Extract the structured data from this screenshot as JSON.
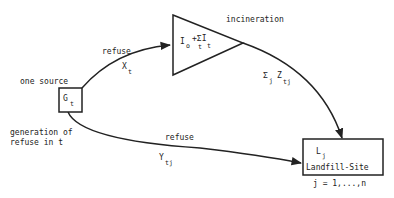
{
  "nodes": {
    "source": {
      "symbol": "G",
      "subscript": "t",
      "label_above": "one source",
      "label_below_line1": "generation of",
      "label_below_line2": "refuse in t"
    },
    "incinerator": {
      "formula_main": "I",
      "formula_sub1": "o",
      "formula_mid": "+ΣI",
      "formula_sub2": "t",
      "formula_sub3": "t",
      "label": "incineration"
    },
    "landfill": {
      "symbol": "L",
      "subscript": "j",
      "label": "Landfill-Site",
      "index_range": "j = 1,...,n"
    }
  },
  "edges": {
    "source_to_incinerator": {
      "label": "refuse",
      "var": "X",
      "var_sub": "t"
    },
    "incinerator_to_landfill": {
      "sigma": "Σ",
      "sigma_sub": "j",
      "var": "Z",
      "var_sub": "tj"
    },
    "source_to_landfill": {
      "label": "refuse",
      "var": "Y",
      "var_sub": "tj"
    }
  }
}
